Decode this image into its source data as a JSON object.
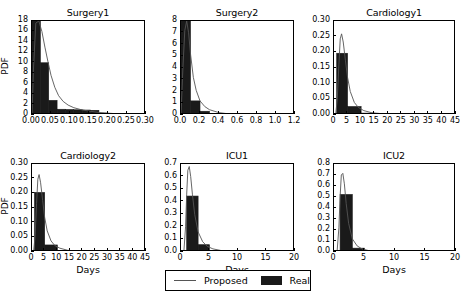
{
  "figure": {
    "width": 464,
    "height": 300,
    "background": "#ffffff",
    "bar_color": "#1a1a1a",
    "line_color": "#555555"
  },
  "legend": {
    "proposed_label": "Proposed",
    "real_label": "Real"
  },
  "chart_data": [
    {
      "type": "bar",
      "title": "Surgery1",
      "xlabel": "",
      "ylabel": "PDF",
      "xlim": [
        0.0,
        0.3
      ],
      "ylim": [
        0,
        18
      ],
      "xticks": [
        "0.00",
        "0.05",
        "0.10",
        "0.15",
        "0.20",
        "0.25",
        "0.30"
      ],
      "xtick_values": [
        0.0,
        0.05,
        0.1,
        0.15,
        0.2,
        0.25,
        0.3
      ],
      "yticks": [
        "0",
        "2",
        "4",
        "6",
        "8",
        "10",
        "12",
        "14",
        "16",
        "18"
      ],
      "ytick_values": [
        0,
        2,
        4,
        6,
        8,
        10,
        12,
        14,
        16,
        18
      ],
      "grid": false,
      "legend_position": "figure-bottom-center",
      "series": [
        {
          "name": "Real",
          "kind": "histogram",
          "bin_edges": [
            0.0,
            0.022,
            0.044,
            0.066,
            0.088,
            0.11,
            0.132,
            0.154,
            0.176,
            0.198,
            0.22
          ],
          "values": [
            18.3,
            10.0,
            2.8,
            1.1,
            1.05,
            1.0,
            0.95,
            0.9,
            0.35,
            0.1
          ]
        },
        {
          "name": "Proposed",
          "kind": "line",
          "x": [
            0.0,
            0.004,
            0.01,
            0.018,
            0.026,
            0.034,
            0.042,
            0.05,
            0.06,
            0.07,
            0.082,
            0.095,
            0.11,
            0.13,
            0.15,
            0.175,
            0.2,
            0.23,
            0.26,
            0.3
          ],
          "y": [
            0.0,
            9.0,
            17.6,
            18.0,
            16.0,
            13.0,
            10.2,
            7.6,
            5.3,
            3.7,
            2.6,
            1.9,
            1.4,
            1.0,
            0.75,
            0.5,
            0.35,
            0.2,
            0.12,
            0.05
          ]
        }
      ]
    },
    {
      "type": "bar",
      "title": "Surgery2",
      "xlabel": "",
      "ylabel": "",
      "xlim": [
        0.0,
        1.2
      ],
      "ylim": [
        0,
        8
      ],
      "xticks": [
        "0.0",
        "0.2",
        "0.4",
        "0.6",
        "0.8",
        "1.0",
        "1.2"
      ],
      "xtick_values": [
        0.0,
        0.2,
        0.4,
        0.6,
        0.8,
        1.0,
        1.2
      ],
      "yticks": [
        "0",
        "1",
        "2",
        "3",
        "4",
        "5",
        "6",
        "7",
        "8"
      ],
      "ytick_values": [
        0,
        1,
        2,
        3,
        4,
        5,
        6,
        7,
        8
      ],
      "grid": false,
      "series": [
        {
          "name": "Real",
          "kind": "histogram",
          "bin_edges": [
            0.0,
            0.1,
            0.2,
            0.3,
            0.4,
            0.5,
            0.6,
            0.7,
            0.8
          ],
          "values": [
            8.3,
            1.2,
            0.32,
            0.1,
            0.04,
            0.02,
            0.06,
            0.02
          ]
        },
        {
          "name": "Proposed",
          "kind": "line",
          "x": [
            0.0,
            0.02,
            0.04,
            0.06,
            0.08,
            0.1,
            0.13,
            0.16,
            0.2,
            0.25,
            0.3,
            0.4,
            0.5,
            0.7,
            0.9,
            1.2
          ],
          "y": [
            0.0,
            4.0,
            7.2,
            8.0,
            7.0,
            5.2,
            3.2,
            2.1,
            1.2,
            0.72,
            0.45,
            0.2,
            0.1,
            0.04,
            0.02,
            0.0
          ]
        }
      ]
    },
    {
      "type": "bar",
      "title": "Cardiology1",
      "xlabel": "",
      "ylabel": "",
      "xlim": [
        0,
        45
      ],
      "ylim": [
        0.0,
        0.3
      ],
      "xticks": [
        "0",
        "5",
        "10",
        "15",
        "20",
        "25",
        "30",
        "35",
        "40",
        "45"
      ],
      "xtick_values": [
        0,
        5,
        10,
        15,
        20,
        25,
        30,
        35,
        40,
        45
      ],
      "yticks": [
        "0.00",
        "0.05",
        "0.10",
        "0.15",
        "0.20",
        "0.25",
        "0.30"
      ],
      "ytick_values": [
        0.0,
        0.05,
        0.1,
        0.15,
        0.2,
        0.25,
        0.3
      ],
      "grid": false,
      "series": [
        {
          "name": "Real",
          "kind": "histogram",
          "bin_edges": [
            1,
            5,
            10,
            15,
            20,
            25,
            30
          ],
          "values": [
            0.197,
            0.027,
            0.006,
            0.002,
            0.001,
            0.0005
          ]
        },
        {
          "name": "Proposed",
          "kind": "line",
          "x": [
            0.6,
            1.2,
            1.8,
            2.3,
            2.8,
            3.4,
            4.2,
            5.0,
            6.0,
            7.5,
            9.0,
            11.0,
            14.0,
            18.0,
            24.0,
            32.0,
            45.0
          ],
          "y": [
            0.0,
            0.05,
            0.16,
            0.243,
            0.259,
            0.233,
            0.175,
            0.12,
            0.075,
            0.04,
            0.024,
            0.014,
            0.007,
            0.004,
            0.002,
            0.001,
            0.0
          ]
        }
      ]
    },
    {
      "type": "bar",
      "title": "Cardiology2",
      "xlabel": "Days",
      "ylabel": "PDF",
      "xlim": [
        0,
        45
      ],
      "ylim": [
        0.0,
        0.3
      ],
      "xticks": [
        "0",
        "5",
        "10",
        "15",
        "20",
        "25",
        "30",
        "35",
        "40",
        "45"
      ],
      "xtick_values": [
        0,
        5,
        10,
        15,
        20,
        25,
        30,
        35,
        40,
        45
      ],
      "yticks": [
        "0.00",
        "0.05",
        "0.10",
        "0.15",
        "0.20",
        "0.25",
        "0.30"
      ],
      "ytick_values": [
        0.0,
        0.05,
        0.1,
        0.15,
        0.2,
        0.25,
        0.3
      ],
      "grid": false,
      "series": [
        {
          "name": "Real",
          "kind": "histogram",
          "bin_edges": [
            1,
            5,
            10,
            15,
            20,
            25
          ],
          "values": [
            0.203,
            0.024,
            0.003,
            0.001,
            0.0005
          ]
        },
        {
          "name": "Proposed",
          "kind": "line",
          "x": [
            0.6,
            1.2,
            1.8,
            2.3,
            2.8,
            3.4,
            4.2,
            5.0,
            6.0,
            7.5,
            9.0,
            11.0,
            14.0,
            18.0,
            24.0,
            32.0,
            45.0
          ],
          "y": [
            0.0,
            0.05,
            0.165,
            0.248,
            0.264,
            0.236,
            0.176,
            0.118,
            0.072,
            0.038,
            0.022,
            0.013,
            0.006,
            0.003,
            0.0015,
            0.0008,
            0.0
          ]
        }
      ]
    },
    {
      "type": "bar",
      "title": "ICU1",
      "xlabel": "Days",
      "ylabel": "",
      "xlim": [
        0,
        20
      ],
      "ylim": [
        0.0,
        0.7
      ],
      "xticks": [
        "0",
        "5",
        "10",
        "15",
        "20"
      ],
      "xtick_values": [
        0,
        5,
        10,
        15,
        20
      ],
      "yticks": [
        "0.0",
        "0.1",
        "0.2",
        "0.3",
        "0.4",
        "0.5",
        "0.6",
        "0.7"
      ],
      "ytick_values": [
        0.0,
        0.1,
        0.2,
        0.3,
        0.4,
        0.5,
        0.6,
        0.7
      ],
      "grid": false,
      "series": [
        {
          "name": "Real",
          "kind": "histogram",
          "bin_edges": [
            1,
            3,
            5,
            7,
            9
          ],
          "values": [
            0.445,
            0.058,
            0.012,
            0.002
          ]
        },
        {
          "name": "Proposed",
          "kind": "line",
          "x": [
            0.5,
            0.8,
            1.0,
            1.2,
            1.45,
            1.7,
            2.0,
            2.4,
            3.0,
            3.8,
            4.6,
            5.6,
            7.0,
            9.0,
            12.0,
            16.0,
            20.0
          ],
          "y": [
            0.0,
            0.2,
            0.46,
            0.65,
            0.68,
            0.6,
            0.46,
            0.3,
            0.16,
            0.082,
            0.045,
            0.025,
            0.012,
            0.005,
            0.002,
            0.0008,
            0.0
          ]
        }
      ]
    },
    {
      "type": "bar",
      "title": "ICU2",
      "xlabel": "Days",
      "ylabel": "",
      "xlim": [
        0,
        20
      ],
      "ylim": [
        0.0,
        0.8
      ],
      "xticks": [
        "0",
        "5",
        "10",
        "15",
        "20"
      ],
      "xtick_values": [
        0,
        5,
        10,
        15,
        20
      ],
      "yticks": [
        "0.0",
        "0.1",
        "0.2",
        "0.3",
        "0.4",
        "0.5",
        "0.6",
        "0.7",
        "0.8"
      ],
      "ytick_values": [
        0.0,
        0.1,
        0.2,
        0.3,
        0.4,
        0.5,
        0.6,
        0.7,
        0.8
      ],
      "grid": false,
      "series": [
        {
          "name": "Real",
          "kind": "histogram",
          "bin_edges": [
            1,
            3,
            5,
            7,
            9
          ],
          "values": [
            0.523,
            0.035,
            0.006,
            0.001
          ]
        },
        {
          "name": "Proposed",
          "kind": "line",
          "x": [
            0.5,
            0.8,
            1.0,
            1.2,
            1.45,
            1.7,
            2.0,
            2.4,
            3.0,
            3.8,
            4.6,
            5.6,
            7.0,
            9.0,
            12.0,
            16.0,
            20.0
          ],
          "y": [
            0.0,
            0.22,
            0.5,
            0.7,
            0.715,
            0.62,
            0.44,
            0.26,
            0.12,
            0.055,
            0.028,
            0.014,
            0.006,
            0.002,
            0.0008,
            0.0003,
            0.0
          ]
        }
      ]
    }
  ],
  "panels": [
    {
      "left": 31,
      "top": 20,
      "width": 114,
      "height": 94
    },
    {
      "left": 180,
      "top": 20,
      "width": 114,
      "height": 94
    },
    {
      "left": 333,
      "top": 20,
      "width": 122,
      "height": 94
    },
    {
      "left": 31,
      "top": 163,
      "width": 114,
      "height": 88
    },
    {
      "left": 180,
      "top": 163,
      "width": 114,
      "height": 88
    },
    {
      "left": 333,
      "top": 163,
      "width": 122,
      "height": 88
    }
  ],
  "legend_box": {
    "left": 165,
    "top": 270,
    "width": 146,
    "height": 21
  }
}
